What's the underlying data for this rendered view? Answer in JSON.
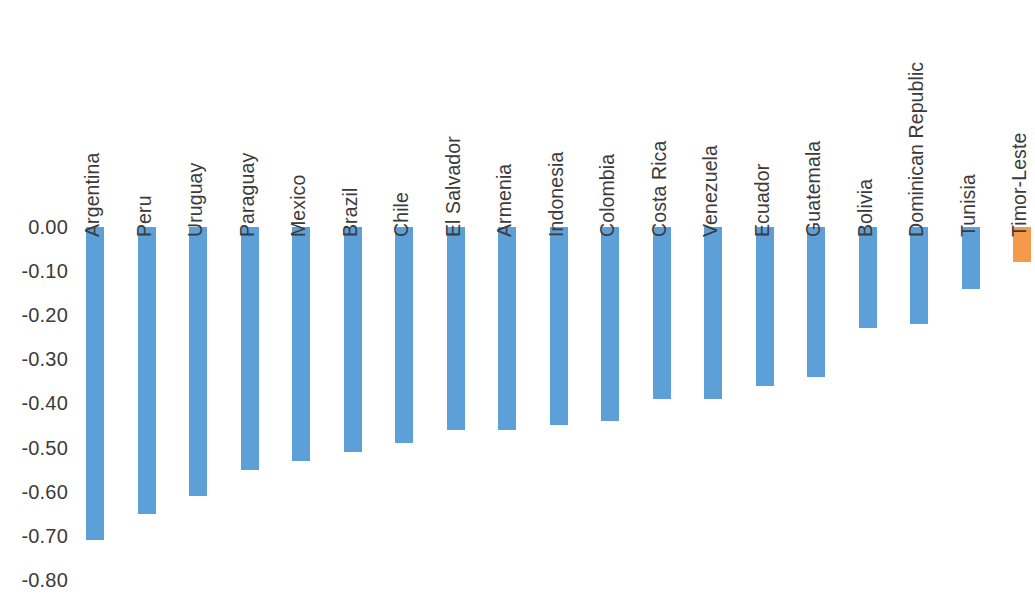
{
  "chart_data": {
    "type": "bar",
    "title": "",
    "subtitle": "",
    "xlabel": "",
    "ylabel": "",
    "orientation": "vertical",
    "grid": false,
    "legend": "none",
    "ylim": [
      -0.8,
      0.0
    ],
    "y_ticks": [
      "0.00",
      "-0.10",
      "-0.20",
      "-0.30",
      "-0.40",
      "-0.50",
      "-0.60",
      "-0.70",
      "-0.80"
    ],
    "y_tick_values": [
      0.0,
      -0.1,
      -0.2,
      -0.3,
      -0.4,
      -0.5,
      -0.6,
      -0.7,
      -0.8
    ],
    "categories": [
      "Argentina",
      "Peru",
      "Uruguay",
      "Paraguay",
      "Mexico",
      "Brazil",
      "Chile",
      "El Salvador",
      "Armenia",
      "Indonesia",
      "Colombia",
      "Costa Rica",
      "Venezuela",
      "Ecuador",
      "Guatemala",
      "Bolivia",
      "Dominican Republic",
      "Tunisia",
      "Timor-Leste"
    ],
    "values": [
      -0.71,
      -0.65,
      -0.61,
      -0.55,
      -0.53,
      -0.51,
      -0.49,
      -0.46,
      -0.46,
      -0.45,
      -0.44,
      -0.39,
      -0.39,
      -0.36,
      -0.34,
      -0.23,
      -0.22,
      -0.14,
      -0.08
    ],
    "bar_colors": [
      "#5DA0D8",
      "#5DA0D8",
      "#5DA0D8",
      "#5DA0D8",
      "#5DA0D8",
      "#5DA0D8",
      "#5DA0D8",
      "#5DA0D8",
      "#5DA0D8",
      "#5DA0D8",
      "#5DA0D8",
      "#5DA0D8",
      "#5DA0D8",
      "#5DA0D8",
      "#5DA0D8",
      "#5DA0D8",
      "#5DA0D8",
      "#5DA0D8",
      "#F49A4C"
    ],
    "colors": {
      "series_default": "#5DA0D8",
      "highlight": "#F49A4C",
      "text": "#3b3b3b",
      "background": "#ffffff"
    }
  }
}
